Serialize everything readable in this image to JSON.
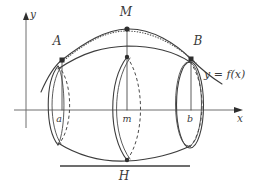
{
  "figure": {
    "axes": {
      "x_label": "x",
      "y_label": "y",
      "x_axis_name": "x-axis",
      "y_axis_name": "y-axis"
    },
    "curve_label": "y = f(x)",
    "points": [
      {
        "name": "A",
        "label": "A",
        "x": 62,
        "y": 60
      },
      {
        "name": "M",
        "label": "M",
        "x": 127,
        "y": 29
      },
      {
        "name": "B",
        "label": "B",
        "x": 191,
        "y": 59
      }
    ],
    "ticks": [
      {
        "name": "a",
        "label": "a",
        "x": 58
      },
      {
        "name": "m",
        "label": "m",
        "x": 127
      },
      {
        "name": "b",
        "label": "b",
        "x": 190
      }
    ],
    "height_label": "H",
    "colors": {
      "ink": "#3d3d3d",
      "axis": "#6e6e6e",
      "background": "#ffffff"
    }
  }
}
